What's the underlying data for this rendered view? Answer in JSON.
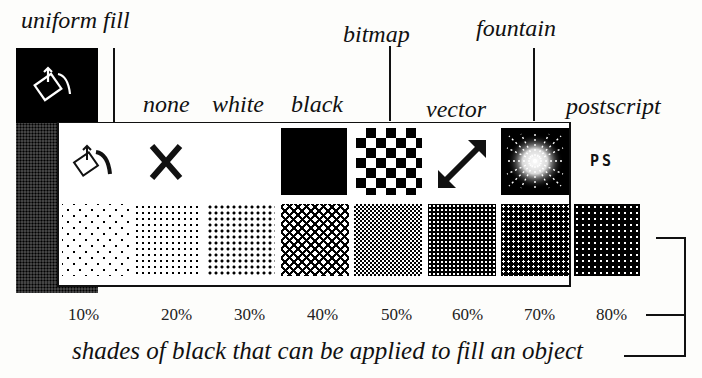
{
  "callouts": {
    "uniform_fill": "uniform fill",
    "none": "none",
    "white": "white",
    "black": "black",
    "bitmap": "bitmap",
    "vector": "vector",
    "fountain": "fountain",
    "postscript": "postscript"
  },
  "tool": {
    "icon": "paint-bucket-icon",
    "flyout_icons": [
      {
        "name": "uniform-fill",
        "icon": "paint-bucket-icon"
      },
      {
        "name": "none",
        "icon": "x-icon"
      },
      {
        "name": "white",
        "icon": "blank"
      },
      {
        "name": "black",
        "icon": "solid-black-swatch"
      },
      {
        "name": "bitmap",
        "icon": "checkerboard-icon"
      },
      {
        "name": "vector",
        "icon": "diagonal-double-arrow-icon"
      },
      {
        "name": "fountain",
        "icon": "radial-burst-icon"
      },
      {
        "name": "postscript",
        "icon": "ps-text-icon",
        "text": "PS"
      }
    ]
  },
  "shades": [
    {
      "label": "10%",
      "value": 10
    },
    {
      "label": "20%",
      "value": 20
    },
    {
      "label": "30%",
      "value": 30
    },
    {
      "label": "40%",
      "value": 40
    },
    {
      "label": "50%",
      "value": 50
    },
    {
      "label": "60%",
      "value": 60
    },
    {
      "label": "70%",
      "value": 70
    },
    {
      "label": "80%",
      "value": 80
    }
  ],
  "caption": "shades of black that can be applied to fill an object"
}
